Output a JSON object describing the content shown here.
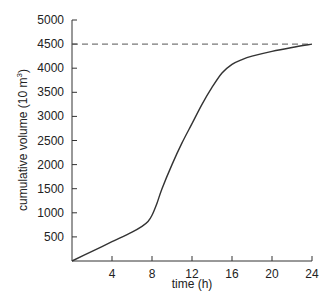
{
  "chart_data": {
    "type": "line",
    "title": "",
    "xlabel": "time (h)",
    "ylabel": "cumulative volume (10 m³)",
    "ylabel_parts": {
      "main": "cumulative volume (10 m",
      "sup": "3",
      "end": ")"
    },
    "xlim": [
      0,
      24
    ],
    "ylim": [
      0,
      5000
    ],
    "xticks": [
      4,
      8,
      12,
      16,
      20,
      24
    ],
    "yticks": [
      500,
      1000,
      1500,
      2000,
      2500,
      3000,
      3500,
      4000,
      4500,
      5000
    ],
    "grid": false,
    "series": [
      {
        "name": "cumulative volume",
        "style": "solid",
        "x": [
          0,
          2,
          4,
          6,
          7,
          7.6,
          8,
          8.5,
          9,
          10,
          11,
          12,
          13,
          14,
          15,
          16,
          17,
          18,
          20,
          22,
          24
        ],
        "y": [
          0,
          200,
          400,
          600,
          720,
          820,
          950,
          1200,
          1500,
          2000,
          2450,
          2850,
          3250,
          3600,
          3900,
          4080,
          4180,
          4250,
          4350,
          4430,
          4500
        ]
      }
    ],
    "reference_lines": [
      {
        "name": "final volume",
        "orientation": "horizontal",
        "value": 4500,
        "style": "dashed"
      }
    ]
  }
}
